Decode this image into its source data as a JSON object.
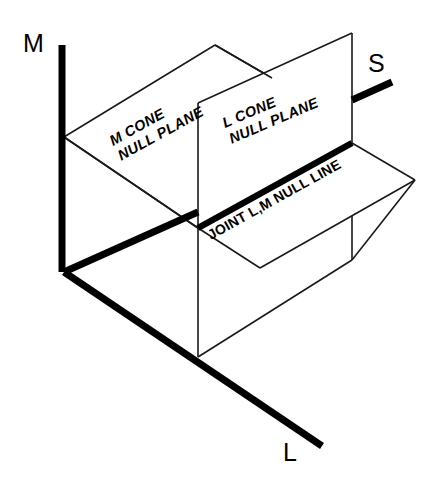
{
  "figure": {
    "background_color": "#ffffff",
    "line_color": "#000000",
    "width": 439,
    "height": 480
  },
  "axes": [
    {
      "id": "m-axis",
      "label": "M",
      "orientation": "vertical-up"
    },
    {
      "id": "s-axis",
      "label": "S",
      "orientation": "diagonal-up-right"
    },
    {
      "id": "l-axis",
      "label": "L",
      "orientation": "diagonal-down-right"
    }
  ],
  "axis_labels": {
    "m": "M",
    "s": "S",
    "l": "L"
  },
  "planes": [
    {
      "id": "m-cone-null-plane",
      "line1": "M CONE",
      "line2": "NULL PLANE",
      "full_label": "M CONE NULL PLANE",
      "rotation_deg": -29
    },
    {
      "id": "l-cone-null-plane",
      "line1": "L CONE",
      "line2": "NULL PLANE",
      "full_label": "L CONE NULL PLANE",
      "rotation_deg": -23
    }
  ],
  "lines": [
    {
      "id": "joint-lm-null-line",
      "label": "JOINT L,M NULL LINE",
      "rotation_deg": -29,
      "style": "thick"
    }
  ]
}
